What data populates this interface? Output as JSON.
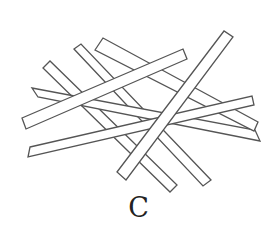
{
  "figure": {
    "caption": "C",
    "stroke_color": "#555555",
    "fill_color": "#ffffff",
    "sticks": [
      {
        "id": "stick-1",
        "points": [
          [
            43,
            68
          ],
          [
            50,
            61
          ],
          [
            177,
            185
          ],
          [
            170,
            192
          ]
        ]
      },
      {
        "id": "stick-2",
        "points": [
          [
            74,
            49
          ],
          [
            81,
            44
          ],
          [
            211,
            180
          ],
          [
            203,
            186
          ]
        ]
      },
      {
        "id": "stick-5",
        "points": [
          [
            32,
            88
          ],
          [
            255,
            130
          ],
          [
            260,
            141
          ],
          [
            38,
            97
          ]
        ]
      },
      {
        "id": "stick-3",
        "points": [
          [
            95,
            50
          ],
          [
            103,
            38
          ],
          [
            258,
            122
          ],
          [
            254,
            131
          ]
        ]
      },
      {
        "id": "stick-6",
        "points": [
          [
            30,
            147
          ],
          [
            252,
            96
          ],
          [
            254,
            105
          ],
          [
            28,
            157
          ]
        ]
      },
      {
        "id": "stick-4",
        "points": [
          [
            22,
            118
          ],
          [
            183,
            49
          ],
          [
            187,
            59
          ],
          [
            26,
            129
          ]
        ]
      },
      {
        "id": "stick-7",
        "points": [
          [
            117,
            172
          ],
          [
            224,
            31
          ],
          [
            233,
            37
          ],
          [
            126,
            180
          ]
        ]
      }
    ]
  }
}
